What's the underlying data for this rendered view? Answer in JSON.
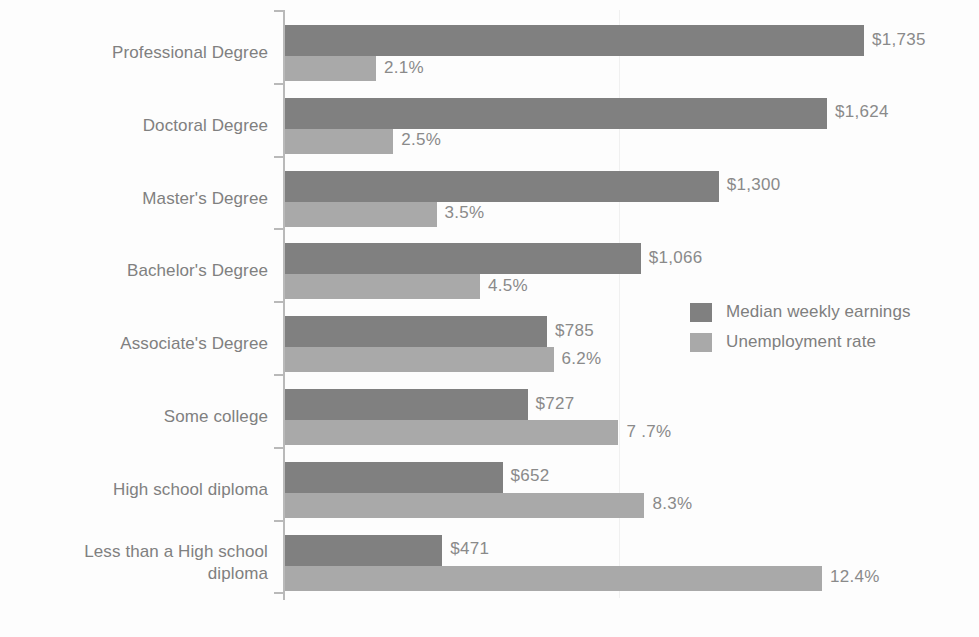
{
  "chart_data": {
    "type": "bar",
    "orientation": "horizontal",
    "title": "",
    "subtitle": "",
    "xlabel": "",
    "ylabel": "",
    "grid": true,
    "gridlines_x": [
      1
    ],
    "legend_position": "middle-right",
    "categories": [
      "Professional Degree",
      "Doctoral Degree",
      "Master's Degree",
      "Bachelor's Degree",
      "Associate's Degree",
      "Some college",
      "High school diploma",
      "Less than a High school\ndiploma"
    ],
    "series": [
      {
        "name": "Median weekly earnings",
        "color": "#808080",
        "unit": "USD",
        "values": [
          1735,
          1624,
          1300,
          1066,
          785,
          727,
          652,
          471
        ],
        "labels": [
          "$1,735",
          "$1,624",
          "$1,300",
          "$1,066",
          "$785",
          "$727",
          "$652",
          "$471"
        ]
      },
      {
        "name": "Unemployment rate",
        "color": "#a9a9a9",
        "unit": "percent",
        "values": [
          2.1,
          2.5,
          3.5,
          4.5,
          6.2,
          7.7,
          8.3,
          12.4
        ],
        "labels": [
          "2.1%",
          "2.5%",
          "3.5%",
          "4.5%",
          "6.2%",
          "7 .7%",
          "8.3%",
          "12.4%"
        ]
      }
    ]
  },
  "legend": {
    "items": [
      {
        "label": "Median weekly earnings",
        "color": "#808080"
      },
      {
        "label": "Unemployment rate",
        "color": "#a9a9a9"
      }
    ]
  },
  "colors": {
    "earnings_bar": "#808080",
    "unemployment_bar": "#a9a9a9",
    "axis": "#b9b9b9",
    "gridline": "#f0f0f0",
    "text": "#808080",
    "background": "#fdfdfd"
  }
}
